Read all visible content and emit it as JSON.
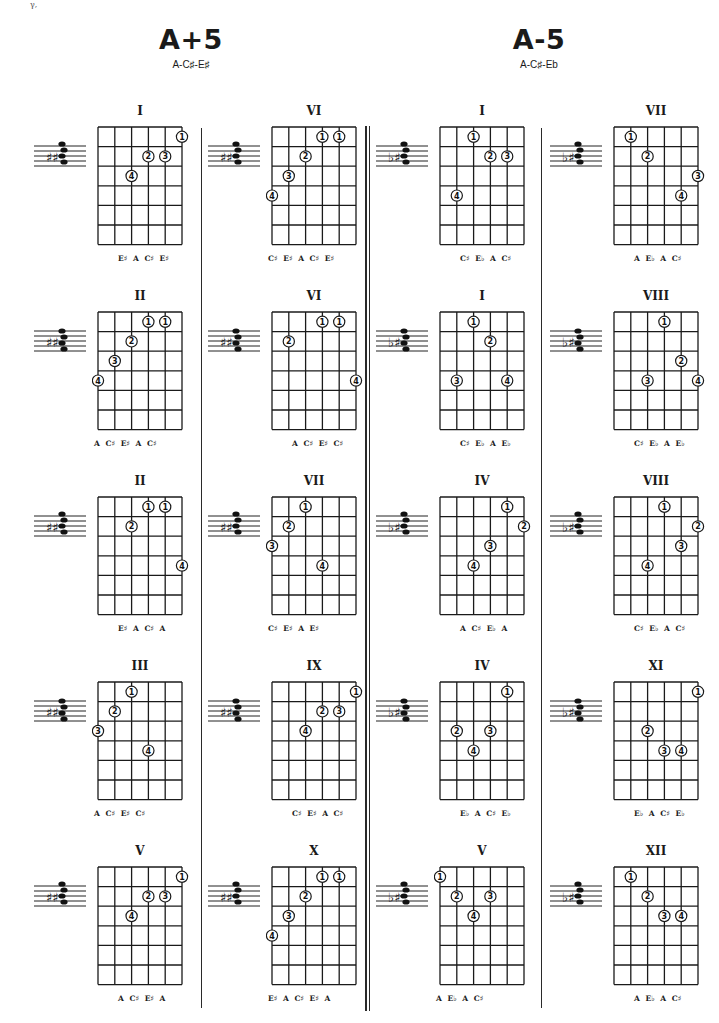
{
  "page": {
    "corner_mark": "γ,"
  },
  "sections": [
    {
      "title": "A+5",
      "notes": "A-C♯-E♯",
      "diagrams": [
        {
          "position": "I",
          "col": 0,
          "row": 0,
          "bottom_notes": "E♯ A C♯ E♯",
          "fingers": [
            [
              5,
              1,
              "1"
            ],
            [
              3,
              2,
              "2"
            ],
            [
              4,
              2,
              "3"
            ],
            [
              2,
              3,
              "4"
            ]
          ]
        },
        {
          "position": "VI",
          "col": 1,
          "row": 0,
          "bottom_notes": "C♯ E♯ A C♯ E♯",
          "fingers": [
            [
              3,
              1,
              "1"
            ],
            [
              4,
              1,
              "1"
            ],
            [
              2,
              2,
              "2"
            ],
            [
              1,
              3,
              "3"
            ],
            [
              0,
              4,
              "4"
            ]
          ]
        },
        {
          "position": "II",
          "col": 0,
          "row": 1,
          "bottom_notes": "A C♯ E♯ A C♯",
          "fingers": [
            [
              3,
              1,
              "1"
            ],
            [
              4,
              1,
              "1"
            ],
            [
              2,
              2,
              "2"
            ],
            [
              1,
              3,
              "3"
            ],
            [
              0,
              4,
              "4"
            ]
          ]
        },
        {
          "position": "VI",
          "col": 1,
          "row": 1,
          "bottom_notes": "A C♯ E♯ C♯",
          "fingers": [
            [
              3,
              1,
              "1"
            ],
            [
              4,
              1,
              "1"
            ],
            [
              1,
              2,
              "2"
            ],
            [
              5,
              4,
              "4"
            ]
          ]
        },
        {
          "position": "II",
          "col": 0,
          "row": 2,
          "bottom_notes": "E♯ A C♯ A",
          "fingers": [
            [
              3,
              1,
              "1"
            ],
            [
              4,
              1,
              "1"
            ],
            [
              2,
              2,
              "2"
            ],
            [
              5,
              4,
              "4"
            ]
          ]
        },
        {
          "position": "VII",
          "col": 1,
          "row": 2,
          "bottom_notes": "C♯ E♯ A E♯",
          "fingers": [
            [
              2,
              1,
              "1"
            ],
            [
              1,
              2,
              "2"
            ],
            [
              0,
              3,
              "3"
            ],
            [
              3,
              4,
              "4"
            ]
          ]
        },
        {
          "position": "III",
          "col": 0,
          "row": 3,
          "bottom_notes": "A C♯ E♯ C♯",
          "fingers": [
            [
              2,
              1,
              "1"
            ],
            [
              1,
              2,
              "2"
            ],
            [
              0,
              3,
              "3"
            ],
            [
              3,
              4,
              "4"
            ]
          ]
        },
        {
          "position": "IX",
          "col": 1,
          "row": 3,
          "bottom_notes": "C♯ E♯ A C♯",
          "fingers": [
            [
              5,
              1,
              "1"
            ],
            [
              3,
              2,
              "2"
            ],
            [
              4,
              2,
              "3"
            ],
            [
              2,
              3,
              "4"
            ]
          ]
        },
        {
          "position": "V",
          "col": 0,
          "row": 4,
          "bottom_notes": "A C♯ E♯ A",
          "fingers": [
            [
              5,
              1,
              "1"
            ],
            [
              3,
              2,
              "2"
            ],
            [
              4,
              2,
              "3"
            ],
            [
              2,
              3,
              "4"
            ]
          ]
        },
        {
          "position": "X",
          "col": 1,
          "row": 4,
          "bottom_notes": "E♯ A C♯ E♯ A",
          "fingers": [
            [
              3,
              1,
              "1"
            ],
            [
              4,
              1,
              "1"
            ],
            [
              2,
              2,
              "2"
            ],
            [
              1,
              3,
              "3"
            ],
            [
              0,
              4,
              "4"
            ]
          ]
        }
      ]
    },
    {
      "title": "A-5",
      "notes": "A-C♯-Eb",
      "diagrams": [
        {
          "position": "I",
          "col": 2,
          "row": 0,
          "bottom_notes": "C♯ E♭ A C♯",
          "fingers": [
            [
              2,
              1,
              "1"
            ],
            [
              3,
              2,
              "2"
            ],
            [
              4,
              2,
              "3"
            ],
            [
              1,
              4,
              "4"
            ]
          ]
        },
        {
          "position": "VII",
          "col": 3,
          "row": 0,
          "bottom_notes": "A E♭ A C♯",
          "fingers": [
            [
              1,
              1,
              "1"
            ],
            [
              2,
              2,
              "2"
            ],
            [
              5,
              3,
              "3"
            ],
            [
              4,
              4,
              "4"
            ]
          ]
        },
        {
          "position": "I",
          "col": 2,
          "row": 1,
          "bottom_notes": "C♯ E♭ A E♭",
          "fingers": [
            [
              2,
              1,
              "1"
            ],
            [
              3,
              2,
              "2"
            ],
            [
              1,
              4,
              "3"
            ],
            [
              4,
              4,
              "4"
            ]
          ]
        },
        {
          "position": "VIII",
          "col": 3,
          "row": 1,
          "bottom_notes": "C♯ E♭ A E♭",
          "fingers": [
            [
              3,
              1,
              "1"
            ],
            [
              4,
              3,
              "2"
            ],
            [
              2,
              4,
              "3"
            ],
            [
              5,
              4,
              "4"
            ]
          ]
        },
        {
          "position": "IV",
          "col": 2,
          "row": 2,
          "bottom_notes": "A C♯ E♭ A",
          "fingers": [
            [
              4,
              1,
              "1"
            ],
            [
              5,
              2,
              "2"
            ],
            [
              3,
              3,
              "3"
            ],
            [
              2,
              4,
              "4"
            ]
          ]
        },
        {
          "position": "VIII",
          "col": 3,
          "row": 2,
          "bottom_notes": "C♯ E♭ A C♯",
          "fingers": [
            [
              3,
              1,
              "1"
            ],
            [
              5,
              2,
              "2"
            ],
            [
              4,
              3,
              "3"
            ],
            [
              2,
              4,
              "4"
            ]
          ]
        },
        {
          "position": "IV",
          "col": 2,
          "row": 3,
          "bottom_notes": "E♭ A C♯ E♭",
          "fingers": [
            [
              4,
              1,
              "1"
            ],
            [
              1,
              3,
              "2"
            ],
            [
              3,
              3,
              "3"
            ],
            [
              2,
              4,
              "4"
            ]
          ]
        },
        {
          "position": "XI",
          "col": 3,
          "row": 3,
          "bottom_notes": "E♭ A C♯ E♭",
          "fingers": [
            [
              5,
              1,
              "1"
            ],
            [
              2,
              3,
              "2"
            ],
            [
              3,
              4,
              "3"
            ],
            [
              4,
              4,
              "4"
            ]
          ]
        },
        {
          "position": "V",
          "col": 2,
          "row": 4,
          "bottom_notes": "A E♭ A C♯",
          "fingers": [
            [
              0,
              1,
              "1"
            ],
            [
              1,
              2,
              "2"
            ],
            [
              3,
              2,
              "3"
            ],
            [
              2,
              3,
              "4"
            ]
          ]
        },
        {
          "position": "XII",
          "col": 3,
          "row": 4,
          "bottom_notes": "A E♭ A C♯",
          "fingers": [
            [
              1,
              1,
              "1"
            ],
            [
              2,
              2,
              "2"
            ],
            [
              3,
              3,
              "3"
            ],
            [
              4,
              3,
              "4"
            ]
          ]
        }
      ]
    }
  ],
  "style": {
    "ink": "#1a1a1a",
    "paper": "#ffffff"
  }
}
